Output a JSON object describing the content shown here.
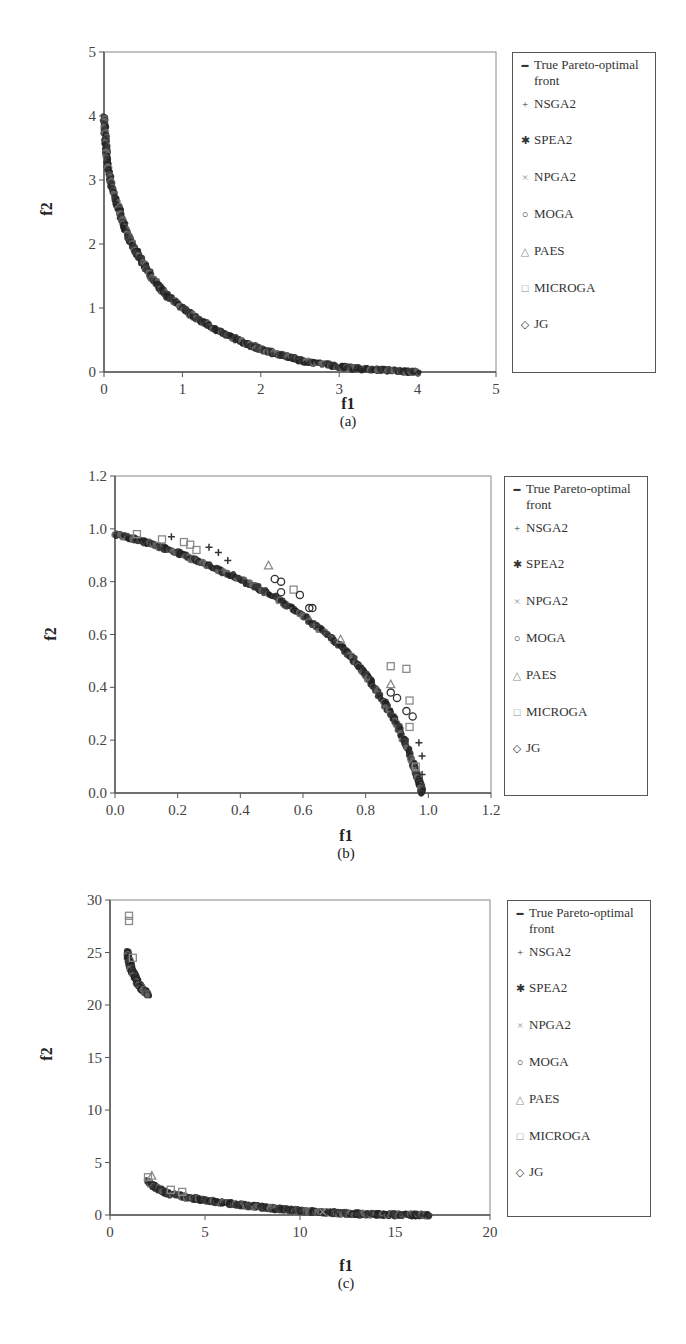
{
  "legend_items": [
    {
      "marker": "dash",
      "glyph": "▬",
      "label": "True Pareto-optimal front"
    },
    {
      "marker": "plus",
      "glyph": "+",
      "label": "NSGA2"
    },
    {
      "marker": "star",
      "glyph": "✱",
      "label": "SPEA2"
    },
    {
      "marker": "cross",
      "glyph": "×",
      "label": "NPGA2"
    },
    {
      "marker": "circle",
      "glyph": "○",
      "label": "MOGA"
    },
    {
      "marker": "triangle",
      "glyph": "△",
      "label": "PAES"
    },
    {
      "marker": "square",
      "glyph": "□",
      "label": "MICROGA"
    },
    {
      "marker": "diamond",
      "glyph": "◇",
      "label": "JG"
    }
  ],
  "colors": {
    "front": "#2a2a2a",
    "marker_dark": "#333333",
    "marker_gray": "#8a8a8a",
    "axis": "#555555"
  },
  "panels": [
    {
      "sub_label": "(a)",
      "xlabel": "f1",
      "ylabel": "f2"
    },
    {
      "sub_label": "(b)",
      "xlabel": "f1",
      "ylabel": "f2"
    },
    {
      "sub_label": "(c)",
      "xlabel": "f1",
      "ylabel": "f2"
    }
  ],
  "chart_data": [
    {
      "type": "scatter",
      "panel": "(a)",
      "title": "",
      "xlabel": "f1",
      "ylabel": "f2",
      "xlim": [
        0,
        5
      ],
      "ylim": [
        0,
        5
      ],
      "xticks": [
        0,
        1,
        2,
        3,
        4,
        5
      ],
      "yticks": [
        0,
        1,
        2,
        3,
        4,
        5
      ],
      "xtick_labels": [
        "0",
        "1",
        "2",
        "3",
        "4",
        "5"
      ],
      "ytick_labels": [
        "0",
        "1",
        "2",
        "3",
        "4",
        "5"
      ],
      "grid": false,
      "legend_position": "right",
      "legend": [
        "True Pareto-optimal front",
        "NSGA2",
        "SPEA2",
        "NPGA2",
        "MOGA",
        "PAES",
        "MICROGA",
        "JG"
      ],
      "front": {
        "description": "convex front from (0,4) to (4,0)",
        "points": [
          [
            0,
            4.0
          ],
          [
            0.02,
            3.6
          ],
          [
            0.05,
            3.2
          ],
          [
            0.1,
            2.9
          ],
          [
            0.2,
            2.5
          ],
          [
            0.3,
            2.15
          ],
          [
            0.4,
            1.9
          ],
          [
            0.5,
            1.7
          ],
          [
            0.6,
            1.5
          ],
          [
            0.8,
            1.2
          ],
          [
            1.0,
            1.0
          ],
          [
            1.2,
            0.82
          ],
          [
            1.5,
            0.62
          ],
          [
            1.8,
            0.45
          ],
          [
            2.0,
            0.36
          ],
          [
            2.3,
            0.25
          ],
          [
            2.6,
            0.16
          ],
          [
            3.0,
            0.08
          ],
          [
            3.4,
            0.04
          ],
          [
            3.7,
            0.02
          ],
          [
            4.0,
            0.0
          ]
        ]
      },
      "outliers": []
    },
    {
      "type": "scatter",
      "panel": "(b)",
      "title": "",
      "xlabel": "f1",
      "ylabel": "f2",
      "xlim": [
        0,
        1.2
      ],
      "ylim": [
        0,
        1.2
      ],
      "xticks": [
        0,
        0.2,
        0.4,
        0.6,
        0.8,
        1.0,
        1.2
      ],
      "yticks": [
        0,
        0.2,
        0.4,
        0.6,
        0.8,
        1.0,
        1.2
      ],
      "xtick_labels": [
        "0.0",
        "0.2",
        "0.4",
        "0.6",
        "0.8",
        "1.0",
        "1.2"
      ],
      "ytick_labels": [
        "0.0",
        "0.2",
        "0.4",
        "0.6",
        "0.8",
        "1.0",
        "1.2"
      ],
      "grid": false,
      "legend_position": "right",
      "legend": [
        "True Pareto-optimal front",
        "NSGA2",
        "SPEA2",
        "NPGA2",
        "MOGA",
        "PAES",
        "MICROGA",
        "JG"
      ],
      "front": {
        "description": "concave front from (0,0.98) to (0.98,0)",
        "points": [
          [
            0,
            0.98
          ],
          [
            0.1,
            0.95
          ],
          [
            0.2,
            0.91
          ],
          [
            0.3,
            0.86
          ],
          [
            0.4,
            0.81
          ],
          [
            0.5,
            0.75
          ],
          [
            0.6,
            0.67
          ],
          [
            0.7,
            0.58
          ],
          [
            0.75,
            0.52
          ],
          [
            0.8,
            0.45
          ],
          [
            0.85,
            0.36
          ],
          [
            0.9,
            0.26
          ],
          [
            0.94,
            0.15
          ],
          [
            0.97,
            0.05
          ],
          [
            0.98,
            0.0
          ]
        ]
      },
      "outliers": [
        {
          "series": "MICROGA",
          "x": 0.07,
          "y": 0.98
        },
        {
          "series": "MICROGA",
          "x": 0.15,
          "y": 0.96
        },
        {
          "series": "MICROGA",
          "x": 0.22,
          "y": 0.95
        },
        {
          "series": "MICROGA",
          "x": 0.24,
          "y": 0.94
        },
        {
          "series": "MICROGA",
          "x": 0.26,
          "y": 0.92
        },
        {
          "series": "NSGA2",
          "x": 0.18,
          "y": 0.97
        },
        {
          "series": "NSGA2",
          "x": 0.3,
          "y": 0.93
        },
        {
          "series": "NSGA2",
          "x": 0.33,
          "y": 0.91
        },
        {
          "series": "NSGA2",
          "x": 0.36,
          "y": 0.88
        },
        {
          "series": "PAES",
          "x": 0.49,
          "y": 0.86
        },
        {
          "series": "MOGA",
          "x": 0.51,
          "y": 0.81
        },
        {
          "series": "MOGA",
          "x": 0.53,
          "y": 0.8
        },
        {
          "series": "MOGA",
          "x": 0.53,
          "y": 0.76
        },
        {
          "series": "MICROGA",
          "x": 0.57,
          "y": 0.77
        },
        {
          "series": "MOGA",
          "x": 0.59,
          "y": 0.75
        },
        {
          "series": "MOGA",
          "x": 0.62,
          "y": 0.7
        },
        {
          "series": "MOGA",
          "x": 0.63,
          "y": 0.7
        },
        {
          "series": "PAES",
          "x": 0.72,
          "y": 0.58
        },
        {
          "series": "MICROGA",
          "x": 0.88,
          "y": 0.48
        },
        {
          "series": "MICROGA",
          "x": 0.93,
          "y": 0.47
        },
        {
          "series": "PAES",
          "x": 0.88,
          "y": 0.41
        },
        {
          "series": "MOGA",
          "x": 0.88,
          "y": 0.38
        },
        {
          "series": "MOGA",
          "x": 0.9,
          "y": 0.36
        },
        {
          "series": "MICROGA",
          "x": 0.94,
          "y": 0.35
        },
        {
          "series": "MOGA",
          "x": 0.93,
          "y": 0.31
        },
        {
          "series": "MOGA",
          "x": 0.95,
          "y": 0.29
        },
        {
          "series": "MICROGA",
          "x": 0.94,
          "y": 0.25
        },
        {
          "series": "NSGA2",
          "x": 0.97,
          "y": 0.19
        },
        {
          "series": "NSGA2",
          "x": 0.98,
          "y": 0.14
        },
        {
          "series": "NSGA2",
          "x": 0.98,
          "y": 0.07
        },
        {
          "series": "MICROGA",
          "x": 0.96,
          "y": 0.1
        }
      ]
    },
    {
      "type": "scatter",
      "panel": "(c)",
      "title": "",
      "xlabel": "f1",
      "ylabel": "f2",
      "xlim": [
        0,
        20
      ],
      "ylim": [
        0,
        30
      ],
      "xticks": [
        0,
        5,
        10,
        15,
        20
      ],
      "yticks": [
        0,
        5,
        10,
        15,
        20,
        25,
        30
      ],
      "xtick_labels": [
        "0",
        "5",
        "10",
        "15",
        "20"
      ],
      "ytick_labels": [
        "0",
        "5",
        "10",
        "15",
        "20",
        "25",
        "30"
      ],
      "grid": false,
      "legend_position": "right",
      "legend": [
        "True Pareto-optimal front",
        "NSGA2",
        "SPEA2",
        "NPGA2",
        "MOGA",
        "PAES",
        "MICROGA",
        "JG"
      ],
      "front": {
        "description": "disconnected front: upper segment f1≈0.9–2.0, f2≈25–21; lower segment f1≈2–16.8, f2≈3.2–0",
        "segments": [
          [
            [
              0.9,
              25.0
            ],
            [
              1.0,
              24.2
            ],
            [
              1.1,
              23.5
            ],
            [
              1.3,
              22.7
            ],
            [
              1.5,
              22.0
            ],
            [
              1.7,
              21.5
            ],
            [
              2.0,
              21.0
            ]
          ],
          [
            [
              2.0,
              3.2
            ],
            [
              2.5,
              2.5
            ],
            [
              3.0,
              2.1
            ],
            [
              4.0,
              1.7
            ],
            [
              5.0,
              1.4
            ],
            [
              6.0,
              1.15
            ],
            [
              7.0,
              0.95
            ],
            [
              8.0,
              0.75
            ],
            [
              9.0,
              0.55
            ],
            [
              10.0,
              0.4
            ],
            [
              11.0,
              0.3
            ],
            [
              12.0,
              0.2
            ],
            [
              13.0,
              0.12
            ],
            [
              14.0,
              0.06
            ],
            [
              15.0,
              0.03
            ],
            [
              16.0,
              0.01
            ],
            [
              16.8,
              0.0
            ]
          ]
        ]
      },
      "outliers": [
        {
          "series": "MICROGA",
          "x": 1.0,
          "y": 28.5
        },
        {
          "series": "MICROGA",
          "x": 1.0,
          "y": 28.0
        },
        {
          "series": "MICROGA",
          "x": 1.2,
          "y": 24.5
        },
        {
          "series": "MICROGA",
          "x": 2.0,
          "y": 3.6
        },
        {
          "series": "PAES",
          "x": 2.2,
          "y": 3.7
        },
        {
          "series": "MICROGA",
          "x": 3.2,
          "y": 2.4
        },
        {
          "series": "MICROGA",
          "x": 3.8,
          "y": 2.2
        },
        {
          "series": "NPGA2",
          "x": 11.2,
          "y": 0.3
        }
      ]
    }
  ]
}
